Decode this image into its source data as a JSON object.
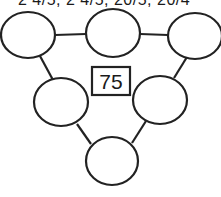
{
  "header": {
    "text": "2 4/5, 2 4/5, 20/5, 20/4"
  },
  "puzzle": {
    "target_number": "75",
    "circles": [
      {
        "id": "top-left",
        "value": ""
      },
      {
        "id": "top-middle",
        "value": ""
      },
      {
        "id": "top-right",
        "value": ""
      },
      {
        "id": "middle-left",
        "value": ""
      },
      {
        "id": "middle-right",
        "value": ""
      },
      {
        "id": "bottom",
        "value": ""
      }
    ],
    "line_color": "#222222"
  }
}
